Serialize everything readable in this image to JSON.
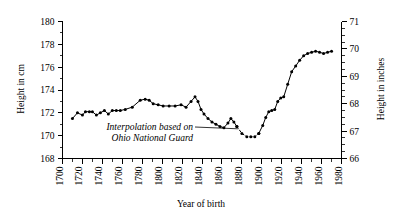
{
  "chart_data": {
    "type": "line",
    "title": "",
    "xlabel": "Year of birth",
    "ylabel": "Height in cm",
    "ylabel_right": "Height in inches",
    "xlim": [
      1700,
      1980
    ],
    "ylim": [
      168,
      180
    ],
    "ylim_right": [
      66,
      71
    ],
    "grid": false,
    "legend": "none",
    "xticks": [
      1700,
      1720,
      1740,
      1760,
      1780,
      1800,
      1820,
      1840,
      1860,
      1880,
      1900,
      1920,
      1940,
      1960,
      1980
    ],
    "xticklabels": [
      "1700",
      "1720",
      "1740",
      "1760",
      "1780",
      "1800",
      "1820",
      "1840",
      "1860",
      "1880",
      "1900",
      "1920",
      "1940",
      "1960",
      "1980"
    ],
    "xtick_minor_step": 10,
    "yticks": [
      168,
      170,
      172,
      174,
      176,
      178,
      180
    ],
    "yticklabels": [
      "168",
      "170",
      "172",
      "174",
      "176",
      "178",
      "180"
    ],
    "ytick_minor_step": 1,
    "yticks_right": [
      66,
      67,
      68,
      69,
      70,
      71
    ],
    "yticklabels_right": [
      "66",
      "67",
      "68",
      "69",
      "70",
      "71"
    ],
    "ytick_right_minor_step": 0.25,
    "xtick_label_rotation": -90,
    "series": [
      {
        "name": "Measured height",
        "style": "solid",
        "marker": "filled-circle",
        "color": "#000000",
        "x": [
          1710,
          1715,
          1720,
          1723,
          1727,
          1730,
          1734,
          1738,
          1742,
          1746,
          1750,
          1754,
          1758,
          1763,
          1770,
          1778,
          1783,
          1787,
          1791,
          1796,
          1801,
          1807,
          1813,
          1819,
          1824,
          1829,
          1833,
          1836,
          1839,
          1842,
          1846,
          1850,
          1854,
          1858,
          1862,
          1866,
          1869,
          1872,
          1875
        ],
        "y": [
          171.5,
          172.0,
          171.8,
          172.1,
          172.1,
          172.1,
          171.8,
          172.0,
          172.2,
          171.9,
          172.2,
          172.2,
          172.2,
          172.3,
          172.5,
          173.1,
          173.2,
          173.1,
          172.8,
          172.7,
          172.6,
          172.6,
          172.6,
          172.7,
          172.5,
          173.0,
          173.4,
          173.0,
          172.3,
          171.9,
          171.5,
          171.2,
          171.0,
          170.8,
          170.7,
          171.1,
          171.5,
          171.2,
          170.8
        ]
      },
      {
        "name": "Interpolation based on Ohio National Guard",
        "style": "dashed",
        "marker": "filled-circle",
        "color": "#000000",
        "x": [
          1875,
          1880,
          1885,
          1889,
          1893,
          1897
        ],
        "y": [
          170.8,
          170.2,
          169.9,
          169.9,
          169.9,
          170.2
        ]
      },
      {
        "name": "Modern cohort",
        "style": "solid",
        "marker": "filled-circle",
        "color": "#000000",
        "x": [
          1897,
          1901,
          1904,
          1907,
          1910,
          1913,
          1916,
          1919,
          1922,
          1926,
          1930,
          1934,
          1938,
          1942,
          1946,
          1950,
          1954,
          1958,
          1962,
          1966,
          1970
        ],
        "y": [
          170.2,
          170.9,
          171.6,
          172.1,
          172.2,
          172.3,
          173.0,
          173.3,
          173.4,
          174.5,
          175.6,
          176.1,
          176.6,
          177.0,
          177.2,
          177.3,
          177.4,
          177.3,
          177.2,
          177.3,
          177.4
        ]
      }
    ],
    "annotation": {
      "line1": "Interpolation based on",
      "line2": "Ohio National Guard",
      "leader_target_x": 1876,
      "leader_target_y": 170.6
    }
  }
}
